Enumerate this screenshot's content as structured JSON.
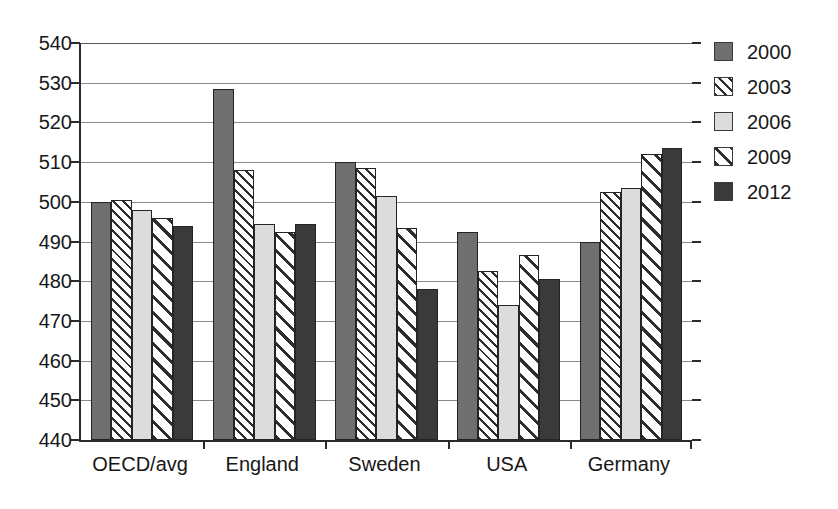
{
  "chart_data": {
    "type": "bar",
    "title": "",
    "subtitle": "",
    "xlabel": "",
    "ylabel": "",
    "categories": [
      "OECD/avg",
      "England",
      "Sweden",
      "USA",
      "Germany"
    ],
    "series": [
      {
        "name": "2000",
        "values": [
          500,
          528.5,
          510,
          492.5,
          490
        ]
      },
      {
        "name": "2003",
        "values": [
          500.5,
          508,
          508.5,
          482.5,
          502.5
        ]
      },
      {
        "name": "2006",
        "values": [
          498,
          494.5,
          501.5,
          474,
          503.5
        ]
      },
      {
        "name": "2009",
        "values": [
          496,
          492.5,
          493.5,
          486.5,
          512
        ]
      },
      {
        "name": "2012",
        "values": [
          494,
          494.5,
          478,
          480.5,
          513.5
        ]
      }
    ],
    "ylim": [
      440,
      540
    ],
    "ytick_labels": [
      "540",
      "530",
      "520",
      "510",
      "500",
      "490",
      "480",
      "470",
      "460",
      "450",
      "440"
    ],
    "ytick_values": [
      540,
      530,
      520,
      510,
      500,
      490,
      480,
      470,
      460,
      450,
      440
    ],
    "grid": true,
    "grid_axis": "y",
    "legend": {
      "position": "right",
      "entries": [
        {
          "label": "2000",
          "pattern": "solid-dark-gray",
          "color": "#6f6f6f"
        },
        {
          "label": "2003",
          "pattern": "hatch-diagonal-fine",
          "color": "#ffffff"
        },
        {
          "label": "2006",
          "pattern": "solid-light-gray",
          "color": "#dcdcdc"
        },
        {
          "label": "2009",
          "pattern": "hatch-diagonal-coarse",
          "color": "#ffffff"
        },
        {
          "label": "2012",
          "pattern": "solid-black",
          "color": "#3a3a3a"
        }
      ]
    }
  }
}
